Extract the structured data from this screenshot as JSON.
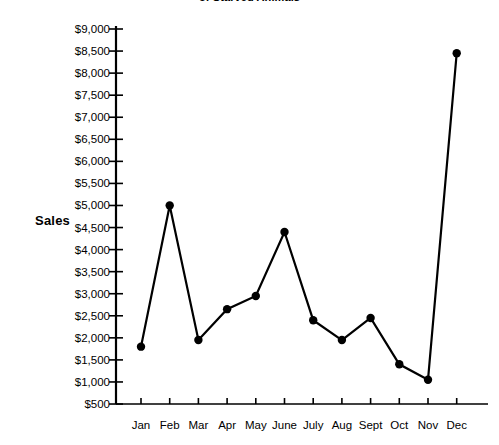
{
  "chart_data": {
    "type": "line",
    "title": "of Starved Animals",
    "xlabel": "",
    "ylabel": "Sales",
    "categories": [
      "Jan",
      "Feb",
      "Mar",
      "Apr",
      "May",
      "June",
      "July",
      "Aug",
      "Sept",
      "Oct",
      "Nov",
      "Dec"
    ],
    "values": [
      1800,
      5000,
      1950,
      2650,
      2950,
      4400,
      2400,
      1950,
      2450,
      1400,
      1050,
      8450
    ],
    "series": [
      {
        "name": "Sales",
        "values": [
          1800,
          5000,
          1950,
          2650,
          2950,
          4400,
          2400,
          1950,
          2450,
          1400,
          1050,
          8450
        ]
      }
    ],
    "ylim": [
      500,
      9000
    ],
    "ytick_step": 500,
    "ytick_labels": [
      "$9,000",
      "$8,500",
      "$8,000",
      "$7,500",
      "$7,000",
      "$6,500",
      "$6,000",
      "$5,500",
      "$5,000",
      "$4,500",
      "$4,000",
      "$3,500",
      "$3,000",
      "$2,500",
      "$2,000",
      "$1,500",
      "$1,000",
      "$500"
    ],
    "ytick_values": [
      9000,
      8500,
      8000,
      7500,
      7000,
      6500,
      6000,
      5500,
      5000,
      4500,
      4000,
      3500,
      3000,
      2500,
      2000,
      1500,
      1000,
      500
    ],
    "grid": false,
    "legend": "none",
    "marker": "filled-circle",
    "line_color": "#000000",
    "marker_color": "#000000",
    "axis_color": "#000000",
    "background_color": "#ffffff"
  }
}
